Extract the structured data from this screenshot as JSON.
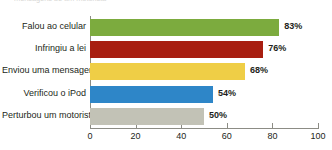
{
  "top_caption": "mensagens de um motorista",
  "chart_data": {
    "type": "bar",
    "orientation": "horizontal",
    "title": "",
    "subtitle": "",
    "xlabel": "",
    "ylabel": "",
    "xlim": [
      0,
      100
    ],
    "grid": false,
    "legend": null,
    "xticks": [
      0,
      20,
      40,
      60,
      80,
      100
    ],
    "xtick_labels": [
      "0",
      "20",
      "40",
      "60",
      "80",
      "100"
    ],
    "categories": [
      "Falou ao celular",
      "Infringiu a lei",
      "Enviou uma mensagem",
      "Verificou o iPod",
      "Perturbou um motorista"
    ],
    "values": [
      83,
      76,
      68,
      54,
      50
    ],
    "data_labels": [
      "83%",
      "76%",
      "68%",
      "54%",
      "50%"
    ],
    "colors": [
      "#7CAB3E",
      "#A81E10",
      "#EFCE46",
      "#2E86C8",
      "#C2C2B6"
    ],
    "axis_color": "#8C8C85",
    "text_color": "#231F20",
    "background": "#FFFFFF"
  }
}
